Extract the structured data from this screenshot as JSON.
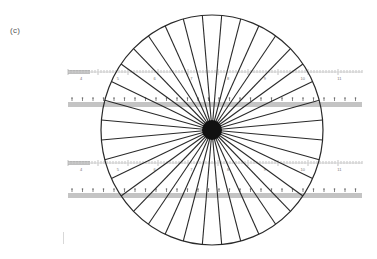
{
  "figure": {
    "panel_label": "(c)"
  },
  "star": {
    "center_x": 212,
    "center_y": 130,
    "radius_x": 111,
    "radius_y": 115,
    "spoke_count": 36,
    "spoke_angle_step_deg": 10,
    "hub_radius": 10,
    "line_color": "#2a2a2a",
    "hub_color": "#111111"
  },
  "rulers": [
    {
      "name": "ruler-top-scale",
      "y": 72,
      "x1": 68,
      "x2": 362,
      "type": "scale",
      "labels": [
        "4",
        "5",
        "6",
        "7",
        "8",
        "9",
        "10",
        "11"
      ]
    },
    {
      "name": "ruler-top-band",
      "y": 103,
      "x1": 68,
      "x2": 362,
      "type": "band",
      "labels": []
    },
    {
      "name": "ruler-bottom-scale",
      "y": 163,
      "x1": 68,
      "x2": 362,
      "type": "scale",
      "labels": [
        "4",
        "5",
        "6",
        "7",
        "8",
        "9",
        "10",
        "11"
      ]
    },
    {
      "name": "ruler-bottom-band",
      "y": 194,
      "x1": 68,
      "x2": 362,
      "type": "band",
      "labels": []
    }
  ],
  "colors": {
    "background": "#ffffff",
    "ruler_band": "#c4c4c4",
    "ruler_tick": "#9a9a9a",
    "ruler_text": "#777777"
  }
}
